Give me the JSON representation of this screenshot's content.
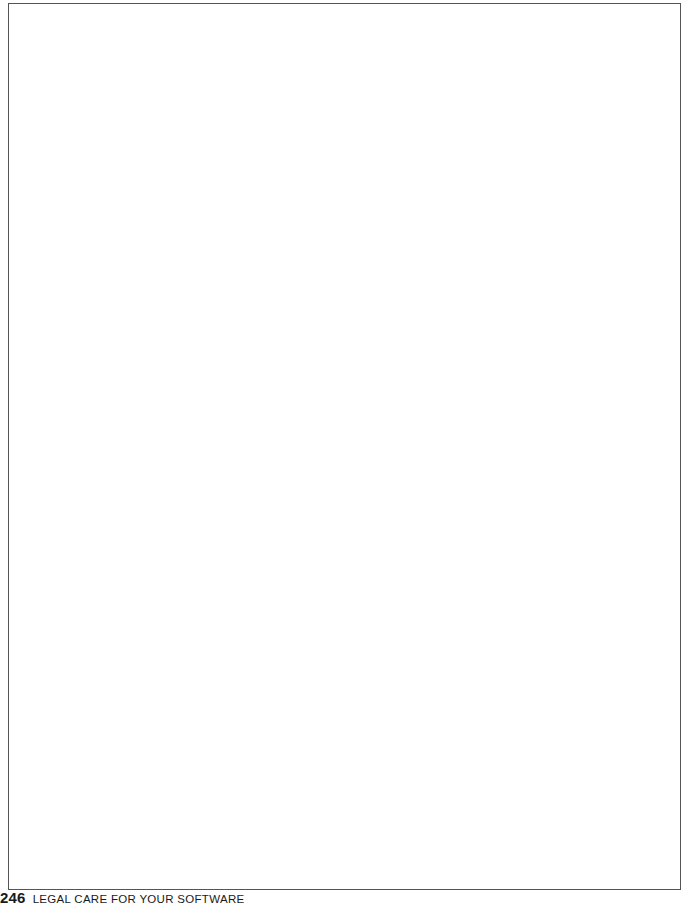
{
  "page": {
    "frame_content": "",
    "footer": {
      "page_number": "246",
      "running_head": "LEGAL CARE FOR YOUR SOFTWARE"
    }
  }
}
